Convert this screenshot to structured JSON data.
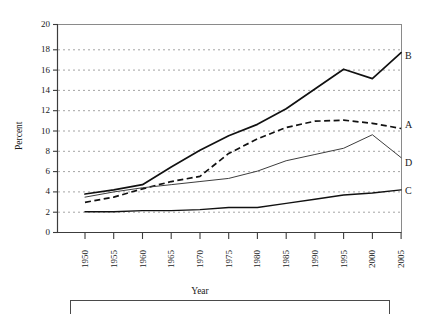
{
  "chart_data": {
    "type": "line",
    "title": "",
    "xlabel": "Year",
    "ylabel": "Percent",
    "xlim": [
      1950,
      2005
    ],
    "ylim": [
      0,
      20
    ],
    "ytick_step": 2,
    "xtick_step": 5,
    "grid": "horizontal-dotted",
    "legend_position": "right-of-line-ends",
    "x": [
      1950,
      1955,
      1960,
      1965,
      1970,
      1975,
      1980,
      1985,
      1990,
      1995,
      2000,
      2005
    ],
    "xticklabels": [
      "1950",
      "1955",
      "1960",
      "1965",
      "1970",
      "1975",
      "1980",
      "1985",
      "1990",
      "1995",
      "2000",
      "2005"
    ],
    "yticklabels": [
      "0",
      "2",
      "4",
      "6",
      "8",
      "10",
      "12",
      "14",
      "16",
      "18",
      "20"
    ],
    "series": [
      {
        "name": "B",
        "label": "B",
        "style": "solid-thick",
        "color": "#111111",
        "values": [
          3.7,
          4.1,
          4.6,
          6.3,
          7.9,
          9.3,
          10.4,
          11.9,
          13.8,
          15.7,
          14.8,
          17.3
        ]
      },
      {
        "name": "A",
        "label": "A",
        "style": "dashed",
        "color": "#111111",
        "values": [
          2.9,
          3.4,
          4.2,
          4.9,
          5.4,
          7.6,
          9.0,
          10.1,
          10.7,
          10.8,
          10.5,
          10.0
        ]
      },
      {
        "name": "D",
        "label": "D",
        "style": "solid-thin",
        "color": "#444444",
        "values": [
          3.4,
          3.9,
          4.3,
          4.6,
          4.9,
          5.2,
          5.9,
          6.9,
          7.5,
          8.1,
          9.4,
          7.2
        ]
      },
      {
        "name": "C",
        "label": "C",
        "style": "solid-medium",
        "color": "#111111",
        "values": [
          2.0,
          2.0,
          2.1,
          2.1,
          2.2,
          2.4,
          2.4,
          2.8,
          3.2,
          3.6,
          3.8,
          4.1
        ]
      }
    ]
  },
  "axes": {
    "y_title": "Percent",
    "x_title": "Year"
  },
  "series_labels": {
    "b": "B",
    "a": "A",
    "d": "D",
    "c": "C"
  }
}
